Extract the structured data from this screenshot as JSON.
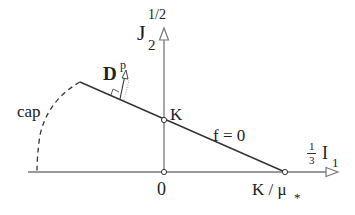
{
  "diagram": {
    "axes": {
      "vertical": {
        "label_main": "J",
        "label_sub": "2",
        "label_sup": "1/2"
      },
      "horizontal": {
        "label_frac_num": "1",
        "label_frac_den": "3",
        "label_main": "I",
        "label_sub": "1"
      }
    },
    "points": {
      "origin": "0",
      "intercept_vertical": "K",
      "intercept_horizontal": "K / μ",
      "intercept_horizontal_sub": "*"
    },
    "curves": {
      "yield_line_label": "f = 0",
      "cap_label": "cap"
    },
    "vectors": {
      "plastic_strain_rate_main": "D",
      "plastic_strain_rate_sup": "p"
    },
    "colors": {
      "axis": "#888888",
      "line": "#333333",
      "text": "#222222"
    }
  }
}
